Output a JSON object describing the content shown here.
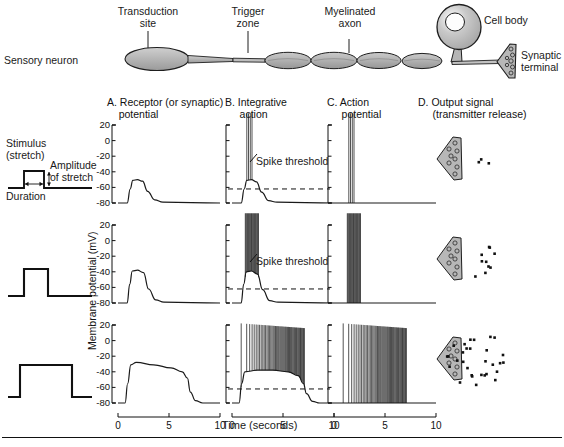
{
  "figure": {
    "neuron_label": "Sensory neuron",
    "annotations": [
      {
        "id": "transduction-site",
        "label": "Transduction\nsite"
      },
      {
        "id": "trigger-zone",
        "label": "Trigger\nzone"
      },
      {
        "id": "myelinated-axon",
        "label": "Myelinated\naxon"
      },
      {
        "id": "cell-body",
        "label": "Cell body"
      },
      {
        "id": "synaptic-terminal",
        "label": "Synaptic\nterminal"
      }
    ]
  },
  "stimulus_legend": {
    "title": "Stimulus\n(stretch)",
    "amplitude_label": "Amplitude\nof stretch",
    "duration_label": "Duration"
  },
  "columns": [
    {
      "id": "A",
      "label": "A. Receptor (or synaptic)\n    potential"
    },
    {
      "id": "B",
      "label": "B. Integrative\n     action"
    },
    {
      "id": "C",
      "label": "C. Action\n     potential"
    },
    {
      "id": "D",
      "label": "D. Output signal\n     (transmitter release)"
    }
  ],
  "axes": {
    "y_label": "Membrane potential (mV)",
    "y_ticks": [
      "20",
      "0",
      "-20",
      "-40",
      "-60",
      "-80"
    ],
    "y_min": -80,
    "y_max": 20,
    "x_label": "Time (seconds)",
    "x_ticks": [
      "0",
      "5",
      "10"
    ],
    "x_min": 0,
    "x_max": 10,
    "threshold_label": "Spike threshold",
    "threshold_mv": -62
  },
  "colors": {
    "ink": "#111111",
    "neuron_fill": "#b9b9b9",
    "neuron_stroke": "#1a1a1a",
    "trace": "#1a1a1a",
    "page": "#ffffff"
  },
  "chart_data": {
    "type": "line",
    "xlabel": "Time (seconds)",
    "ylabel": "Membrane potential (mV)",
    "xlim": [
      0,
      10
    ],
    "ylim": [
      -80,
      20
    ],
    "grid": false,
    "legend": "none",
    "resting_potential_mv": -80,
    "threshold_mv": -62,
    "rows": [
      {
        "row": 1,
        "stimulus": {
          "amplitude": "small",
          "onset_s": 0.6,
          "offset_s": 2.4,
          "height_units": 1
        },
        "A_receptor_potential": {
          "peak_mv": -50,
          "onset_s": 0.9,
          "plateau_start_s": 1.4,
          "plateau_end_s": 2.4,
          "return_end_s": 4.3,
          "points": [
            [
              0,
              -80
            ],
            [
              0.9,
              -80
            ],
            [
              1.2,
              -62
            ],
            [
              1.45,
              -51
            ],
            [
              1.9,
              -50
            ],
            [
              2.4,
              -52
            ],
            [
              2.9,
              -65
            ],
            [
              3.6,
              -76
            ],
            [
              4.4,
              -79
            ],
            [
              10,
              -80
            ]
          ]
        },
        "B_integrative_action": {
          "spike_count": 4,
          "spike_times_s": [
            1.45,
            1.62,
            1.79,
            1.96
          ],
          "spike_peak_mv": 35,
          "subthreshold_points": [
            [
              0,
              -80
            ],
            [
              0.9,
              -80
            ],
            [
              1.2,
              -62
            ],
            [
              1.45,
              -51
            ],
            [
              1.9,
              -50
            ],
            [
              2.4,
              -53
            ],
            [
              2.9,
              -66
            ],
            [
              3.6,
              -77
            ],
            [
              4.4,
              -79
            ],
            [
              10,
              -80
            ]
          ]
        },
        "C_action_potential": {
          "spike_count": 4,
          "spike_times_s": [
            1.45,
            1.62,
            1.79,
            1.96
          ],
          "spike_peak_mv": 35
        },
        "D_transmitter_release": {
          "vesicle_dot_count": 3
        }
      },
      {
        "row": 2,
        "stimulus": {
          "amplitude": "medium",
          "onset_s": 0.6,
          "offset_s": 2.6,
          "height_units": 1.6
        },
        "A_receptor_potential": {
          "peak_mv": -38,
          "onset_s": 0.9,
          "plateau_end_s": 2.5,
          "return_end_s": 4.4,
          "points": [
            [
              0,
              -80
            ],
            [
              0.9,
              -80
            ],
            [
              1.15,
              -56
            ],
            [
              1.4,
              -39
            ],
            [
              1.9,
              -38
            ],
            [
              2.5,
              -41
            ],
            [
              3.0,
              -62
            ],
            [
              3.7,
              -76
            ],
            [
              4.5,
              -79
            ],
            [
              10,
              -80
            ]
          ]
        },
        "B_integrative_action": {
          "spike_count": 18,
          "spike_start_s": 1.3,
          "spike_end_s": 2.6,
          "spike_peak_mv": 35,
          "subthreshold_points": [
            [
              0,
              -80
            ],
            [
              0.9,
              -80
            ],
            [
              1.15,
              -56
            ],
            [
              1.4,
              -40
            ],
            [
              1.9,
              -39
            ],
            [
              2.5,
              -43
            ],
            [
              3.0,
              -63
            ],
            [
              3.7,
              -77
            ],
            [
              4.5,
              -79
            ],
            [
              10,
              -80
            ]
          ]
        },
        "C_action_potential": {
          "spike_count": 18,
          "spike_start_s": 1.3,
          "spike_end_s": 2.6,
          "spike_peak_mv": 35
        },
        "D_transmitter_release": {
          "vesicle_dot_count": 10
        }
      },
      {
        "row": 3,
        "stimulus": {
          "amplitude": "large",
          "onset_s": 0.6,
          "offset_s": 7.0,
          "height_units": 1.8
        },
        "A_receptor_potential": {
          "peak_mv": -28,
          "onset_s": 0.7,
          "plateau_end_s": 6.7,
          "return_end_s": 8.6,
          "points": [
            [
              0,
              -80
            ],
            [
              0.7,
              -80
            ],
            [
              0.95,
              -55
            ],
            [
              1.25,
              -31
            ],
            [
              1.8,
              -28
            ],
            [
              3.5,
              -31
            ],
            [
              5.2,
              -35
            ],
            [
              6.3,
              -40
            ],
            [
              6.8,
              -48
            ],
            [
              7.1,
              -66
            ],
            [
              7.6,
              -77
            ],
            [
              8.3,
              -80
            ],
            [
              10,
              -80
            ]
          ]
        },
        "B_integrative_action": {
          "spike_count": 52,
          "spike_start_s": 0.9,
          "spike_end_s": 7.1,
          "spike_peak_mv": 22,
          "adaptation": true,
          "subthreshold_points": [
            [
              0,
              -80
            ],
            [
              0.7,
              -80
            ],
            [
              0.95,
              -55
            ],
            [
              1.25,
              -40
            ],
            [
              2.5,
              -38
            ],
            [
              4.0,
              -38
            ],
            [
              5.5,
              -40
            ],
            [
              6.5,
              -45
            ],
            [
              7.0,
              -55
            ],
            [
              7.3,
              -68
            ],
            [
              7.9,
              -78
            ],
            [
              8.6,
              -80
            ],
            [
              10,
              -80
            ]
          ]
        },
        "C_action_potential": {
          "spike_count": 52,
          "spike_start_s": 0.9,
          "spike_end_s": 7.1,
          "spike_peak_mv": 22,
          "adaptation": true
        },
        "D_transmitter_release": {
          "vesicle_dot_count": 30
        }
      }
    ]
  }
}
